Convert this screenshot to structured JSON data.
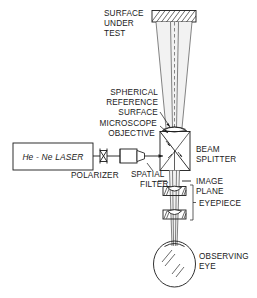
{
  "figure": {
    "background_color": "#ffffff",
    "line_color": "#1a1a1a",
    "width": 257,
    "height": 298
  },
  "labels": {
    "surface_under_test_l1": "SURFACE",
    "surface_under_test_l2": "UNDER",
    "surface_under_test_l3": "TEST",
    "spherical_l1": "SPHERICAL",
    "spherical_l2": "REFERENCE",
    "spherical_l3": "SURFACE",
    "microscope_l1": "MICROSCOPE",
    "microscope_l2": "OBJECTIVE",
    "laser": "He - Ne LASER",
    "polarizer": "POLARIZER",
    "spatial_filter_l1": "SPATIAL",
    "spatial_filter_l2": "FILTER",
    "beam_splitter_l1": "BEAM",
    "beam_splitter_l2": "SPLITTER",
    "image_plane_l1": "IMAGE",
    "image_plane_l2": "PLANE",
    "eyepiece": "EYEPIECE",
    "observing_eye_l1": "OBSERVING",
    "observing_eye_l2": "EYE"
  },
  "components": [
    {
      "id": "surface-under-test",
      "kind": "hatched-plate"
    },
    {
      "id": "spherical-reference-surface",
      "kind": "lens"
    },
    {
      "id": "microscope-objective",
      "kind": "objective"
    },
    {
      "id": "he-ne-laser",
      "kind": "box"
    },
    {
      "id": "polarizer",
      "kind": "hourglass"
    },
    {
      "id": "spatial-filter",
      "kind": "barrel"
    },
    {
      "id": "beam-splitter",
      "kind": "cube"
    },
    {
      "id": "image-plane",
      "kind": "tick-marks"
    },
    {
      "id": "eyepiece",
      "kind": "lens-pair"
    },
    {
      "id": "observing-eye",
      "kind": "eyeball"
    }
  ]
}
